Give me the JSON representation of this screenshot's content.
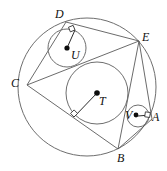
{
  "figure": {
    "type": "geometry-diagram",
    "width": 167,
    "height": 171,
    "background_color": "#ffffff",
    "stroke_color": "#6e6e6e",
    "label_color": "#111111"
  },
  "circumcircle": {
    "name": "outer-circle",
    "cx": 87,
    "cy": 87,
    "r": 69
  },
  "inner_circles": [
    {
      "id": "U",
      "label": "U",
      "cx": 67,
      "cy": 48,
      "r": 19,
      "label_x": 71,
      "label_y": 49
    },
    {
      "id": "T",
      "label": "T",
      "cx": 97,
      "cy": 93,
      "r": 31,
      "label_x": 99,
      "label_y": 95
    },
    {
      "id": "V",
      "label": "V",
      "cx": 138,
      "cy": 116,
      "r": 11,
      "label_x": 126,
      "label_y": 111
    }
  ],
  "vertices": [
    {
      "id": "D",
      "label": "D",
      "x": 66,
      "y": 22,
      "label_x": 55,
      "label_y": 8
    },
    {
      "id": "E",
      "label": "E",
      "x": 139,
      "y": 41,
      "label_x": 142,
      "label_y": 31
    },
    {
      "id": "C",
      "label": "C",
      "x": 27,
      "y": 85,
      "label_x": 12,
      "label_y": 77
    },
    {
      "id": "A",
      "label": "A",
      "x": 152,
      "y": 119,
      "label_x": 152,
      "label_y": 111
    },
    {
      "id": "B",
      "label": "B",
      "x": 118,
      "y": 149,
      "label_x": 117,
      "label_y": 152
    }
  ],
  "radii_segments": [
    {
      "from": "U",
      "to_point": "tangent-on-DE",
      "x1": 67,
      "y1": 48,
      "x2": 75,
      "y2": 30
    },
    {
      "from": "T",
      "to_point": "tangent-on-CB",
      "x1": 97,
      "y1": 93,
      "x2": 74,
      "y2": 117
    },
    {
      "from": "V",
      "to_point": "tangent-on-EA",
      "x1": 138,
      "y1": 116,
      "x2": 150,
      "y2": 115
    }
  ],
  "right_angle_marks": [
    {
      "at": "tangent-on-DE",
      "x": 75,
      "y": 30,
      "size": 5,
      "rotation": -22
    },
    {
      "at": "tangent-on-CB",
      "x": 74,
      "y": 117,
      "size": 5,
      "rotation": -44
    },
    {
      "at": "tangent-on-EA",
      "x": 150,
      "y": 115,
      "size": 5,
      "rotation": 8
    }
  ],
  "chords": [
    {
      "id": "chord-CD",
      "from": "C",
      "to": "D"
    },
    {
      "id": "chord-DE",
      "from": "D",
      "to": "E"
    },
    {
      "id": "chord-CE",
      "from": "C",
      "to": "E"
    },
    {
      "id": "chord-EA",
      "from": "E",
      "to": "A"
    },
    {
      "id": "chord-EB",
      "from": "E",
      "to": "B"
    },
    {
      "id": "chord-AB",
      "from": "A",
      "to": "B"
    },
    {
      "id": "chord-CB",
      "from": "C",
      "to": "B"
    }
  ]
}
